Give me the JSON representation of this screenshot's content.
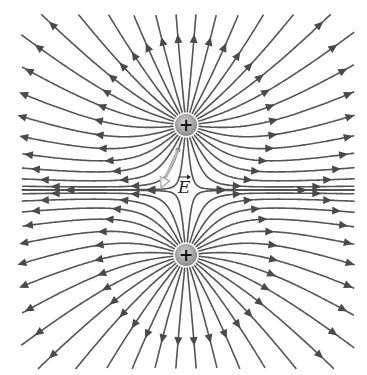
{
  "diagram": {
    "width": 367,
    "height": 375,
    "clip": {
      "x0": 21,
      "y0": 14,
      "x1": 355,
      "y1": 369
    },
    "colors": {
      "background": "#ffffff",
      "field_line": "#555555",
      "arrow": "#4a4a4a",
      "charge_fill_center": "#d8d8d8",
      "charge_fill_edge": "#8a8a8a",
      "charge_sign": "#111111",
      "e_vector": "#b4b4b4"
    },
    "charges": [
      {
        "name": "top-charge",
        "x": 186,
        "y": 125,
        "q": 1,
        "sign": "+",
        "radius": 11
      },
      {
        "name": "bottom-charge",
        "x": 186,
        "y": 255,
        "q": 1,
        "sign": "+",
        "radius": 11
      }
    ],
    "lines_per_charge": 32,
    "field_direction": "outward",
    "e_vector": {
      "label": "E",
      "arrow_over_label": true,
      "start": {
        "x": 178,
        "y": 150
      },
      "end": {
        "x": 161,
        "y": 188
      },
      "label_position": {
        "x": 178,
        "y": 179
      }
    }
  }
}
